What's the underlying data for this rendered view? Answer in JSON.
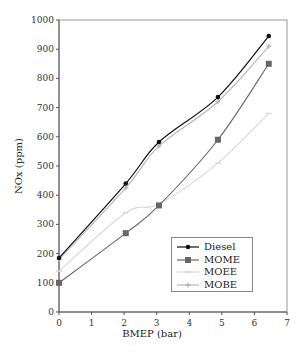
{
  "chart_data": {
    "type": "line",
    "title": "",
    "xlabel": "BMEP (bar)",
    "ylabel": "NOx (ppm)",
    "xlim": [
      0,
      7
    ],
    "ylim": [
      0,
      1000
    ],
    "xticks": [
      0,
      1,
      2,
      3,
      4,
      5,
      6,
      7
    ],
    "yticks": [
      0,
      100,
      200,
      300,
      400,
      500,
      600,
      700,
      800,
      900,
      1000
    ],
    "grid": false,
    "legend_position": "lower right (inside)",
    "series": [
      {
        "name": "Diesel",
        "color": "#111111",
        "marker": "circle",
        "x": [
          0,
          2.05,
          3.07,
          4.88,
          6.44
        ],
        "y": [
          185,
          440,
          582,
          736,
          945
        ]
      },
      {
        "name": "MOME",
        "color": "#666666",
        "marker": "square",
        "x": [
          0,
          2.05,
          3.07,
          4.88,
          6.44
        ],
        "y": [
          100,
          270,
          365,
          590,
          850
        ]
      },
      {
        "name": "MOEE",
        "color": "#d9d9d9",
        "marker": "dash",
        "x": [
          0,
          2.05,
          3.07,
          4.88,
          6.44
        ],
        "y": [
          140,
          340,
          370,
          510,
          680
        ]
      },
      {
        "name": "MOBE",
        "color": "#b5b5b5",
        "marker": "plus",
        "x": [
          0,
          2.05,
          3.07,
          4.88,
          6.44
        ],
        "y": [
          180,
          425,
          568,
          720,
          910
        ]
      }
    ]
  },
  "legend": {
    "items": [
      {
        "label": "Diesel"
      },
      {
        "label": "MOME"
      },
      {
        "label": "MOEE"
      },
      {
        "label": "MOBE"
      }
    ]
  },
  "axes": {
    "x_title": "BMEP (bar)",
    "y_title": "NOx (ppm)"
  }
}
